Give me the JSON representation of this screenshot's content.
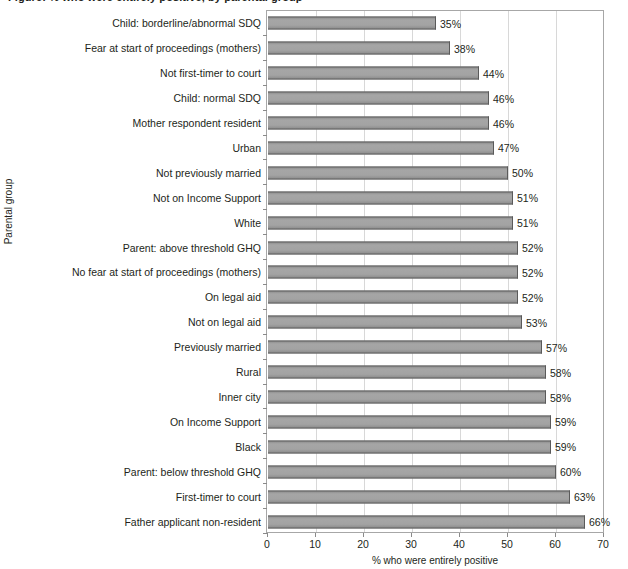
{
  "figure": {
    "caption": "Figure: % who were entirely positive, by parental group"
  },
  "chart_data": {
    "type": "bar",
    "orientation": "horizontal",
    "title": "",
    "xlabel": "% who were entirely positive",
    "ylabel": "Parental group",
    "xlim": [
      0,
      70
    ],
    "xticks": [
      0,
      10,
      20,
      30,
      40,
      50,
      60,
      70
    ],
    "xtick_labels": [
      "0",
      "10",
      "20",
      "30",
      "40",
      "50",
      "60",
      "70"
    ],
    "grid": "vertical",
    "legend": "none",
    "bar_color": "#9d9d9d",
    "bar_edge_color": "#5a5a5a",
    "value_suffix": "%",
    "categories": [
      "Child: borderline/abnormal SDQ",
      "Fear at start of proceedings (mothers)",
      "Not first-timer to court",
      "Child: normal SDQ",
      "Mother respondent resident",
      "Urban",
      "Not previously married",
      "Not on Income Support",
      "White",
      "Parent: above threshold GHQ",
      "No fear at start of proceedings (mothers)",
      "On legal aid",
      "Not on legal aid",
      "Previously married",
      "Rural",
      "Inner city",
      "On Income Support",
      "Black",
      "Parent: below threshold GHQ",
      "First-timer to court",
      "Father applicant non-resident"
    ],
    "values": [
      35,
      38,
      44,
      46,
      46,
      47,
      50,
      51,
      51,
      52,
      52,
      52,
      53,
      57,
      58,
      58,
      59,
      59,
      60,
      63,
      66
    ],
    "value_labels": [
      "35%",
      "38%",
      "44%",
      "46%",
      "46%",
      "47%",
      "50%",
      "51%",
      "51%",
      "52%",
      "52%",
      "52%",
      "53%",
      "57%",
      "58%",
      "58%",
      "59%",
      "59%",
      "60%",
      "63%",
      "66%"
    ]
  }
}
